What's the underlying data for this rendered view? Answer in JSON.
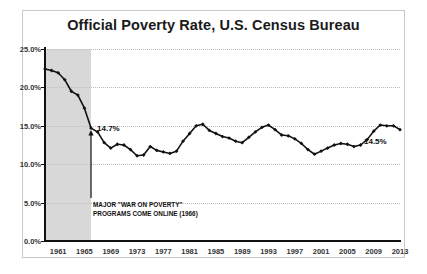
{
  "chart_data": {
    "type": "line",
    "title": "Official Poverty Rate, U.S. Census Bureau",
    "xlabel": "",
    "ylabel": "",
    "ylim": [
      0,
      25
    ],
    "xlim": [
      1959,
      2013
    ],
    "grid": true,
    "grid_style": "dotted-horizontal",
    "legend": "none",
    "ytick_labels": [
      "0.0%",
      "5.0%",
      "10.0%",
      "15.0%",
      "20.0%",
      "25.0%"
    ],
    "ytick_values": [
      0,
      5,
      10,
      15,
      20,
      25
    ],
    "xtick_labels": [
      "1961",
      "1965",
      "1969",
      "1973",
      "1977",
      "1981",
      "1985",
      "1989",
      "1993",
      "1997",
      "2001",
      "2005",
      "2009",
      "2013"
    ],
    "xtick_values": [
      1961,
      1965,
      1969,
      1973,
      1977,
      1981,
      1985,
      1989,
      1993,
      1997,
      2001,
      2005,
      2009,
      2013
    ],
    "marker": "diamond",
    "line_color": "#111111",
    "shaded_region": {
      "label": "pre-War-on-Poverty era",
      "x_start": 1959,
      "x_end": 1966,
      "color": "#d8d8d8"
    },
    "x": [
      1959,
      1960,
      1961,
      1962,
      1963,
      1964,
      1965,
      1966,
      1967,
      1968,
      1969,
      1970,
      1971,
      1972,
      1973,
      1974,
      1975,
      1976,
      1977,
      1978,
      1979,
      1980,
      1981,
      1982,
      1983,
      1984,
      1985,
      1986,
      1987,
      1988,
      1989,
      1990,
      1991,
      1992,
      1993,
      1994,
      1995,
      1996,
      1997,
      1998,
      1999,
      2000,
      2001,
      2002,
      2003,
      2004,
      2005,
      2006,
      2007,
      2008,
      2009,
      2010,
      2011,
      2012,
      2013
    ],
    "values": [
      22.4,
      22.2,
      21.9,
      21.0,
      19.5,
      19.0,
      17.3,
      14.7,
      14.2,
      12.8,
      12.1,
      12.6,
      12.5,
      11.9,
      11.1,
      11.2,
      12.3,
      11.8,
      11.6,
      11.4,
      11.7,
      13.0,
      14.0,
      15.0,
      15.2,
      14.4,
      14.0,
      13.6,
      13.4,
      13.0,
      12.8,
      13.5,
      14.2,
      14.8,
      15.1,
      14.5,
      13.8,
      13.7,
      13.3,
      12.7,
      11.9,
      11.3,
      11.7,
      12.1,
      12.5,
      12.7,
      12.6,
      12.3,
      12.5,
      13.2,
      14.3,
      15.1,
      15.0,
      15.0,
      14.5
    ],
    "data_labels": [
      {
        "label": "14.7%",
        "year": 1966,
        "value": 14.7
      },
      {
        "label": "14.5%",
        "year": 2013,
        "value": 14.5
      }
    ],
    "annotations": [
      {
        "line1": "MAJOR \"WAR ON POVERTY\"",
        "line2": "PROGRAMS COME ONLINE (1966)",
        "points_to_year": 1966,
        "points_to_value": 14.7,
        "arrow": "up"
      }
    ]
  }
}
